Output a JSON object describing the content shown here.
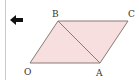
{
  "navigation": {
    "back_icon": "arrow-left-icon"
  },
  "figure": {
    "type": "parallelogram",
    "fill_color": "#f7dfdf",
    "stroke_color": "#8a7a72",
    "vertices": {
      "O": {
        "label": "O",
        "x": 30,
        "y": 63
      },
      "A": {
        "label": "A",
        "x": 100,
        "y": 63
      },
      "C": {
        "label": "C",
        "x": 128,
        "y": 21
      },
      "B": {
        "label": "B",
        "x": 58,
        "y": 21
      }
    },
    "diagonal": [
      "B",
      "A"
    ]
  }
}
